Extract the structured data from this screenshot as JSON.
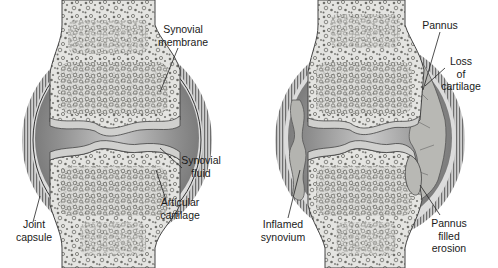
{
  "figure": {
    "panels": [
      {
        "id": "normal-joint",
        "description": "Normal synovial joint",
        "labels": [
          {
            "key": "synovial_membrane",
            "lines": [
              "Synovial",
              "membrane"
            ]
          },
          {
            "key": "synovial_fluid",
            "lines": [
              "Synovial",
              "fluid"
            ]
          },
          {
            "key": "articular_cartilage",
            "lines": [
              "Articular",
              "cartilage"
            ]
          },
          {
            "key": "joint_capsule",
            "lines": [
              "Joint",
              "capsule"
            ]
          }
        ]
      },
      {
        "id": "rheumatoid-joint",
        "description": "Joint affected by rheumatoid arthritis",
        "labels": [
          {
            "key": "pannus",
            "lines": [
              "Pannus"
            ]
          },
          {
            "key": "loss_of_cartilage",
            "lines": [
              "Loss",
              "of",
              "cartilage"
            ]
          },
          {
            "key": "inflamed_synovium",
            "lines": [
              "Inflamed",
              "synovium"
            ]
          },
          {
            "key": "pannus_filled_erosion",
            "lines": [
              "Pannus",
              "filled",
              "erosion"
            ]
          }
        ]
      }
    ],
    "colors": {
      "background": "#ffffff",
      "bone": "#e6e6e3",
      "trabecula": "#8a8a86",
      "capsule_stripe": "#7a7a7a",
      "synovial_fluid": "#8c8c8c",
      "cartilage": "#d2d2d0",
      "pannus": "#b8b8b4",
      "text": "#1a1a1a"
    }
  }
}
